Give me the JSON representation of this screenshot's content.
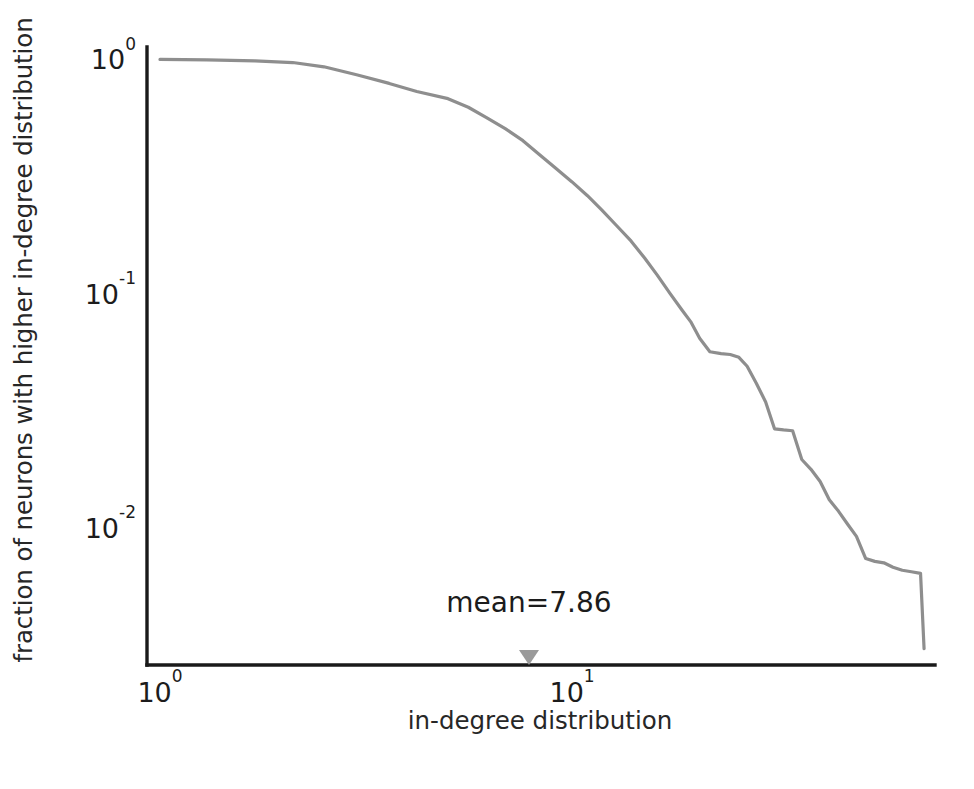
{
  "chart_data": {
    "type": "line",
    "title": "",
    "subtitle": "",
    "xlabel": "in-degree distribution",
    "ylabel": "fraction of neurons with higher in-degree distribution",
    "xscale": "log",
    "yscale": "log",
    "xlim": [
      0.93,
      76.0
    ],
    "ylim": [
      0.0026,
      1.13
    ],
    "grid": false,
    "legend": null,
    "legend_position": "none",
    "xticks": [
      {
        "value": 1,
        "label": "10",
        "exponent": "0"
      },
      {
        "value": 10,
        "label": "10",
        "exponent": "1"
      }
    ],
    "yticks": [
      {
        "value": 1,
        "label": "10",
        "exponent": "0"
      },
      {
        "value": 0.1,
        "label": "10",
        "exponent": "-1"
      },
      {
        "value": 0.01,
        "label": "10",
        "exponent": "-2"
      }
    ],
    "series": [
      {
        "name": "in-degree CCDF",
        "color": "#8e8e8e",
        "linewidth": 3.2,
        "x": [
          1.0,
          1.3,
          1.7,
          2.1,
          2.5,
          3.0,
          3.6,
          4.2,
          5.0,
          5.6,
          6.2,
          6.9,
          7.6,
          8.3,
          9.1,
          10.0,
          10.9,
          11.8,
          12.8,
          13.9,
          15.0,
          16.1,
          17.3,
          18.5,
          19.4,
          20.4,
          21.6,
          23.0,
          24.2,
          25.4,
          26.6,
          28.0,
          29.5,
          31.0,
          32.6,
          34.3,
          36.1,
          38.0,
          40.0,
          42.1,
          44.3,
          46.6,
          49.0,
          51.6,
          54.3,
          57.1,
          60.1,
          63.3,
          66.6,
          70.1,
          71.5
        ],
        "y": [
          1.0,
          0.995,
          0.985,
          0.97,
          0.93,
          0.86,
          0.79,
          0.73,
          0.68,
          0.625,
          0.565,
          0.505,
          0.45,
          0.395,
          0.345,
          0.3,
          0.262,
          0.228,
          0.196,
          0.168,
          0.142,
          0.12,
          0.1,
          0.085,
          0.076,
          0.0645,
          0.0565,
          0.0555,
          0.055,
          0.0535,
          0.049,
          0.0415,
          0.0345,
          0.0265,
          0.0262,
          0.026,
          0.0196,
          0.0178,
          0.0158,
          0.0132,
          0.0118,
          0.0104,
          0.0092,
          0.0074,
          0.0072,
          0.0071,
          0.0068,
          0.0066,
          0.0065,
          0.0064,
          0.00305
        ]
      }
    ],
    "annotations": [
      {
        "name": "mean-label",
        "text": "mean=7.86",
        "x": 7.86,
        "y": 0.0047,
        "marker": "triangle-down",
        "marker_x": 7.86,
        "marker_color": "#9a9a9a"
      }
    ]
  },
  "axes": {
    "left_spine_color": "#1a1a1a",
    "bottom_spine_color": "#1a1a1a"
  }
}
